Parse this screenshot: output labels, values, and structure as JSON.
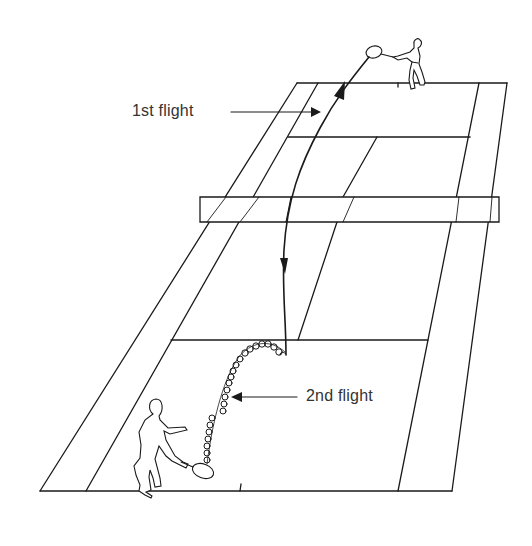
{
  "figure": {
    "labels": {
      "first_flight": "1st flight",
      "second_flight": "2nd flight"
    },
    "colors": {
      "line": "#1a1a1a",
      "text": "#333333",
      "background": "#ffffff"
    },
    "elements": [
      "court",
      "net",
      "server-figure",
      "receiver-figure",
      "1st-flight-path",
      "2nd-flight-path"
    ]
  }
}
